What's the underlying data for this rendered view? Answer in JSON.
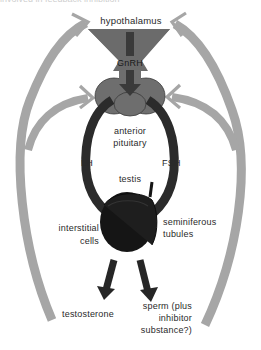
{
  "caption": "involved in feedback inhibition",
  "diagram": {
    "colors": {
      "feedback_arrow": "#a6a6a6",
      "hypothalamus": "#6b6b6b",
      "pituitary": "#6e6e6e",
      "hormone_pathway": "#2b2b2b",
      "gnrh_arrow": "#3a3a3a",
      "testis": "#151515",
      "output_arrow": "#262626"
    },
    "labels": {
      "hypothalamus": "hypothalamus",
      "gnrh": "GnRH",
      "anterior_pituitary_line1": "anterior",
      "anterior_pituitary_line2": "pituitary",
      "lh": "LH",
      "fsh": "FSH",
      "testis": "testis",
      "interstitial_line1": "interstitial",
      "interstitial_line2": "cells",
      "seminiferous_line1": "seminiferous",
      "seminiferous_line2": "tubules",
      "testosterone": "testosterone",
      "sperm_line1": "sperm (plus",
      "sperm_line2": "inhibitor",
      "sperm_line3": "substance?)"
    },
    "nodes": [
      {
        "id": "hypothalamus",
        "label": "hypothalamus"
      },
      {
        "id": "anterior-pituitary",
        "label": "anterior pituitary"
      },
      {
        "id": "testis",
        "label": "testis"
      },
      {
        "id": "interstitial-cells",
        "label": "interstitial cells"
      },
      {
        "id": "seminiferous-tubules",
        "label": "seminiferous tubules"
      },
      {
        "id": "testosterone",
        "label": "testosterone"
      },
      {
        "id": "sperm",
        "label": "sperm (plus inhibitor substance?)"
      }
    ],
    "edges": [
      {
        "from": "hypothalamus",
        "to": "anterior-pituitary",
        "label": "GnRH"
      },
      {
        "from": "anterior-pituitary",
        "to": "interstitial-cells",
        "label": "LH"
      },
      {
        "from": "anterior-pituitary",
        "to": "seminiferous-tubules",
        "label": "FSH"
      },
      {
        "from": "interstitial-cells",
        "to": "testosterone",
        "label": ""
      },
      {
        "from": "seminiferous-tubules",
        "to": "sperm",
        "label": ""
      },
      {
        "from": "testosterone",
        "to": "hypothalamus",
        "label": "feedback"
      },
      {
        "from": "testosterone",
        "to": "anterior-pituitary",
        "label": "feedback"
      },
      {
        "from": "sperm",
        "to": "hypothalamus",
        "label": "feedback"
      },
      {
        "from": "sperm",
        "to": "anterior-pituitary",
        "label": "feedback"
      }
    ]
  }
}
